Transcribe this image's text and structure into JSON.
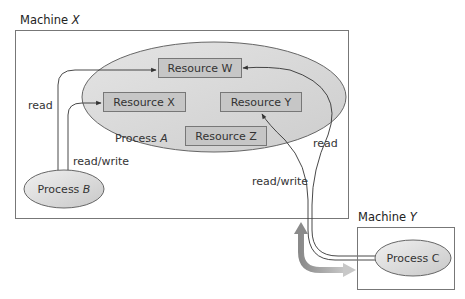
{
  "machines": [
    {
      "id": "machine-x",
      "label_prefix": "Machine ",
      "label_var": "X"
    },
    {
      "id": "machine-y",
      "label_prefix": "Machine ",
      "label_var": "Y"
    }
  ],
  "processes": {
    "a": {
      "label_prefix": "Process ",
      "label_var": "A"
    },
    "b": {
      "label_prefix": "Process ",
      "label_var": "B"
    },
    "c": {
      "label": "Process C"
    }
  },
  "resources": [
    {
      "id": "w",
      "label": "Resource W"
    },
    {
      "id": "x",
      "label": "Resource X"
    },
    {
      "id": "y",
      "label": "Resource Y"
    },
    {
      "id": "z",
      "label": "Resource Z"
    }
  ],
  "edges": [
    {
      "from": "Process B",
      "to": "Resource W",
      "label": "read"
    },
    {
      "from": "Process B",
      "to": "Resource X",
      "label": "read/write"
    },
    {
      "from": "Process C",
      "to": "Resource W",
      "label": "read"
    },
    {
      "from": "Process C",
      "to": "Resource Y",
      "label": "read/write"
    }
  ],
  "colors": {
    "ellipse_fill": "#d4d4d4",
    "resource_fill": "#c4c4c4",
    "stroke": "#555555",
    "big_arrow": "#9a9a9a"
  }
}
